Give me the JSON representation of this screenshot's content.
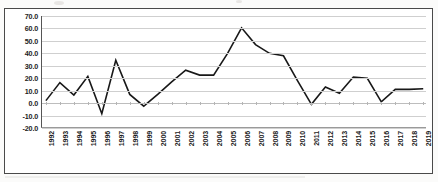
{
  "chart_data": {
    "type": "line",
    "title": "",
    "subtitle": "",
    "xlabel": "",
    "ylabel": "",
    "grid": true,
    "legend": false,
    "legend_position": "none",
    "ylim": [
      -20.0,
      70.0
    ],
    "ytick_step": 10.0,
    "ytick_labels": [
      "70.0",
      "60.0",
      "50.0",
      "40.0",
      "30.0",
      "20.0",
      "10.0",
      "0.0",
      "-10.0",
      "-20.0"
    ],
    "ytick_values": [
      70.0,
      60.0,
      50.0,
      40.0,
      30.0,
      20.0,
      10.0,
      0.0,
      -10.0,
      -20.0
    ],
    "categories": [
      "1992",
      "1993",
      "1994",
      "1995",
      "1996",
      "1997",
      "1998",
      "1999",
      "2000",
      "2001",
      "2002",
      "2003",
      "2004",
      "2005",
      "2006",
      "2007",
      "2008",
      "2009",
      "2010",
      "2011",
      "2012",
      "2013",
      "2014",
      "2015",
      "2016",
      "2017",
      "2018",
      "2019"
    ],
    "values": [
      2.0,
      16.5,
      6.5,
      21.5,
      -8.5,
      34.5,
      7.0,
      -2.5,
      7.0,
      17.0,
      26.5,
      22.5,
      22.5,
      40.0,
      60.5,
      47.0,
      40.0,
      38.0,
      18.0,
      -1.0,
      13.0,
      8.0,
      21.0,
      20.0,
      1.0,
      11.0,
      11.0,
      11.5
    ],
    "series": [
      {
        "name": "series-1",
        "color": "#181818",
        "values": [
          2.0,
          16.5,
          6.5,
          21.5,
          -8.5,
          34.5,
          7.0,
          -2.5,
          7.0,
          17.0,
          26.5,
          22.5,
          22.5,
          40.0,
          60.5,
          47.0,
          40.0,
          38.0,
          18.0,
          -1.0,
          13.0,
          8.0,
          21.0,
          20.0,
          1.0,
          11.0,
          11.0,
          11.5
        ]
      }
    ]
  },
  "colors": {
    "line": "#181818",
    "grid": "#cfcfcf",
    "axis": "#555555",
    "frame": "#4a4a4a",
    "text": "#1c1c1c",
    "background": "#ffffff",
    "page": "#fbfbfa"
  }
}
